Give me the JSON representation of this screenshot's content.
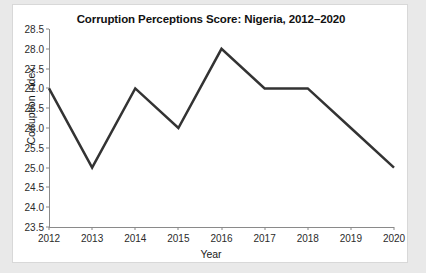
{
  "chart_data": {
    "type": "line",
    "title": "Corruption Perceptions Score: Nigeria, 2012–2020",
    "xlabel": "Year",
    "ylabel": "Corruption index",
    "categories": [
      2012,
      2013,
      2014,
      2015,
      2016,
      2017,
      2018,
      2019,
      2020
    ],
    "values": [
      27.0,
      25.0,
      27.0,
      26.0,
      28.0,
      27.0,
      27.0,
      26.0,
      25.0
    ],
    "series": [
      {
        "name": "Corruption index",
        "values": [
          27.0,
          25.0,
          27.0,
          26.0,
          28.0,
          27.0,
          27.0,
          26.0,
          25.0
        ]
      }
    ],
    "xtick_labels": [
      "2012",
      "2013",
      "2014",
      "2015",
      "2016",
      "2017",
      "2018",
      "2019",
      "2020"
    ],
    "ytick_labels": [
      "23.5",
      "24.0",
      "24.5",
      "25.0",
      "25.5",
      "26.0",
      "26.5",
      "27.0",
      "27.5",
      "28.0",
      "28.5"
    ],
    "ytick_values": [
      23.5,
      24.0,
      24.5,
      25.0,
      25.5,
      26.0,
      26.5,
      27.0,
      27.5,
      28.0,
      28.5
    ],
    "ylim": [
      23.5,
      28.5
    ],
    "xlim": [
      2012,
      2020
    ],
    "grid": false,
    "legend": "none",
    "line_color": "#333333",
    "line_width": 2.5,
    "markers": false,
    "plot_background": "#ffffff",
    "page_background": "#e9e9e9",
    "axis_color": "#8a8a8a",
    "text_color": "#1a1a1a"
  }
}
